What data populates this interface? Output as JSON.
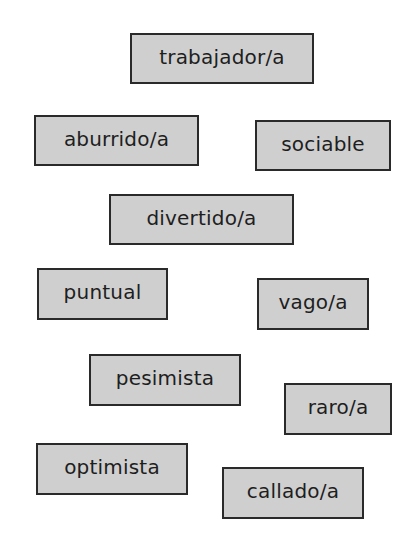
{
  "cards": [
    {
      "label": "trabajador/a",
      "x": 130,
      "y": 33,
      "w": 184,
      "h": 51
    },
    {
      "label": "aburrido/a",
      "x": 34,
      "y": 115,
      "w": 165,
      "h": 51
    },
    {
      "label": "sociable",
      "x": 255,
      "y": 120,
      "w": 136,
      "h": 51
    },
    {
      "label": "divertido/a",
      "x": 109,
      "y": 194,
      "w": 185,
      "h": 51
    },
    {
      "label": "puntual",
      "x": 37,
      "y": 268,
      "w": 131,
      "h": 52
    },
    {
      "label": "vago/a",
      "x": 257,
      "y": 278,
      "w": 112,
      "h": 52
    },
    {
      "label": "pesimista",
      "x": 89,
      "y": 354,
      "w": 152,
      "h": 52
    },
    {
      "label": "raro/a",
      "x": 284,
      "y": 383,
      "w": 108,
      "h": 52
    },
    {
      "label": "optimista",
      "x": 36,
      "y": 443,
      "w": 152,
      "h": 52
    },
    {
      "label": "callado/a",
      "x": 222,
      "y": 467,
      "w": 142,
      "h": 52
    }
  ],
  "colors": {
    "card_fill": "#cfcfcf",
    "card_border": "#2a2a2a",
    "text": "#1e1e1e"
  }
}
